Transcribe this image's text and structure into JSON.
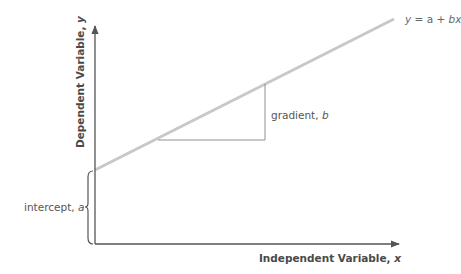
{
  "diagram": {
    "equation": {
      "y": "y",
      "eq": " = a + ",
      "bx": "bx"
    },
    "axes": {
      "x_label_text": "Independent Variable, ",
      "x_label_var": "x",
      "y_label_text": "Dependent Variable, ",
      "y_label_var": "y"
    },
    "annotations": {
      "gradient_text": "gradient, ",
      "gradient_var": "b",
      "intercept_text": "intercept, ",
      "intercept_var": "a"
    },
    "colors": {
      "axis": "#555555",
      "regression_line": "#c8c8c8",
      "gradient_triangle": "#909090",
      "text": "#555555"
    }
  }
}
